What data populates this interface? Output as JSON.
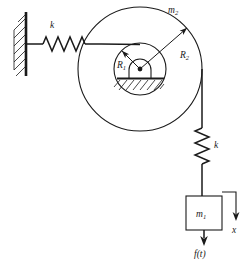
{
  "figure": {
    "background_color": "#ffffff",
    "line_color": "#1a1a1a",
    "width": 252,
    "height": 260
  },
  "labels": {
    "spring_horizontal": "k",
    "spring_vertical": "k",
    "pulley_mass": "m",
    "pulley_mass_sub": "2",
    "block_mass": "m",
    "block_mass_sub": "1",
    "radius_inner": "R",
    "radius_inner_sub": "1",
    "radius_outer": "R",
    "radius_outer_sub": "2",
    "displacement": "x",
    "force": "f(t)"
  },
  "components": {
    "wall": {
      "name": "fixed-wall-support",
      "hatched": true
    },
    "spring_h": {
      "name": "horizontal-spring",
      "coils": 6
    },
    "cord_h": {
      "name": "horizontal-cord"
    },
    "pulley_outer": {
      "name": "outer-pulley-circle",
      "radius": 62
    },
    "pulley_inner": {
      "name": "inner-pulley-circle",
      "radius": 26
    },
    "pivot": {
      "name": "pivot-bearing"
    },
    "ground": {
      "name": "ground-hatching"
    },
    "cord_v": {
      "name": "vertical-cord"
    },
    "spring_v": {
      "name": "vertical-spring",
      "coils": 6
    },
    "block": {
      "name": "mass-block"
    },
    "arrow_x": {
      "name": "displacement-arrow",
      "direction": "down"
    },
    "arrow_f": {
      "name": "force-arrow",
      "direction": "down"
    }
  }
}
